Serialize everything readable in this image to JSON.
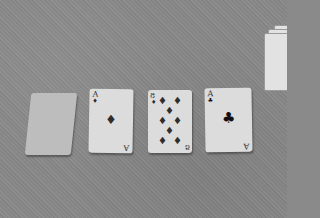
{
  "scene": {
    "description": "Playing cards laid on gray carpet",
    "cards": [
      {
        "id": "card-1",
        "face": "down",
        "label": ""
      },
      {
        "id": "card-2",
        "rank": "A",
        "suit": "diamond",
        "symbol": "♦"
      },
      {
        "id": "card-3",
        "rank": "8",
        "suit": "diamond",
        "symbol": "♦"
      },
      {
        "id": "card-4",
        "rank": "A",
        "suit": "club",
        "symbol": "♣"
      }
    ],
    "deck_stack": {
      "label": "card stack"
    }
  }
}
